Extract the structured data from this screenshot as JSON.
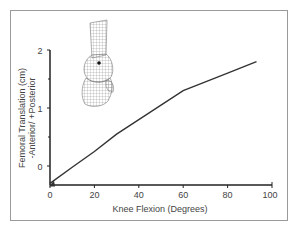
{
  "chart_data": {
    "type": "line",
    "title": "",
    "xlabel": "Knee Flexion (Degrees)",
    "ylabel_line1": "Femoral Translation (cm)",
    "ylabel_line2": "-Anterior/ +Posterior",
    "xlim": [
      0,
      100
    ],
    "ylim": [
      -0.33,
      2
    ],
    "x_ticks": [
      0,
      20,
      40,
      60,
      80,
      100
    ],
    "y_ticks": [
      0,
      1,
      2
    ],
    "y_minor_ticks": [
      0.5,
      1.5
    ],
    "grid": false,
    "legend": null,
    "series": [
      {
        "name": "Femoral translation",
        "x": [
          0,
          10,
          20,
          30,
          40,
          50,
          60,
          70,
          80,
          93
        ],
        "y": [
          -0.3,
          -0.02,
          0.25,
          0.55,
          0.8,
          1.05,
          1.3,
          1.45,
          1.6,
          1.8
        ],
        "start_marker": "triangle"
      }
    ],
    "annotations": [
      "wireframe knee model illustration (upper left)"
    ]
  },
  "labels": {
    "x_tick_0": "0",
    "x_tick_20": "20",
    "x_tick_40": "40",
    "x_tick_60": "60",
    "x_tick_80": "80",
    "x_tick_100": "100",
    "y_tick_0": "0",
    "y_tick_1": "1",
    "y_tick_2": "2",
    "xlabel": "Knee Flexion (Degrees)",
    "ylabel_line1": "Femoral Translation (cm)",
    "ylabel_line2": "-Anterior/ +Posterior"
  },
  "colors": {
    "line": "#333333",
    "axis": "#222222",
    "frame": "#9a9a9a",
    "text": "#444444"
  }
}
